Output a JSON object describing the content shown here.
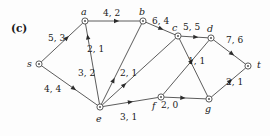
{
  "figure": {
    "panel_label": "(c)",
    "nodes": [
      {
        "id": "s",
        "label": "s",
        "x": 39,
        "y": 64,
        "label_x": 27,
        "label_y": 59
      },
      {
        "id": "a",
        "label": "a",
        "x": 85,
        "y": 21,
        "label_x": 81,
        "label_y": 7
      },
      {
        "id": "b",
        "label": "b",
        "x": 143,
        "y": 21,
        "label_x": 139,
        "label_y": 7
      },
      {
        "id": "c",
        "label": "c",
        "x": 178,
        "y": 36,
        "label_x": 172,
        "label_y": 23
      },
      {
        "id": "d",
        "label": "d",
        "x": 211,
        "y": 38,
        "label_x": 207,
        "label_y": 24
      },
      {
        "id": "t",
        "label": "t",
        "x": 248,
        "y": 66,
        "label_x": 257,
        "label_y": 60
      },
      {
        "id": "e",
        "label": "e",
        "x": 100,
        "y": 107,
        "label_x": 96,
        "label_y": 114
      },
      {
        "id": "f",
        "label": "f",
        "x": 161,
        "y": 97,
        "label_x": 152,
        "label_y": 101
      },
      {
        "id": "g",
        "label": "g",
        "x": 209,
        "y": 99,
        "label_x": 205,
        "label_y": 104
      }
    ],
    "edges": [
      {
        "id": "s-a",
        "from": "s",
        "to": "a",
        "label": "5, 3",
        "label_x": 48,
        "label_y": 34,
        "arrow_t": 0.62
      },
      {
        "id": "s-e",
        "from": "s",
        "to": "e",
        "label": "4, 4",
        "label_x": 44,
        "label_y": 85,
        "arrow_t": 0.58
      },
      {
        "id": "a-b",
        "from": "a",
        "to": "b",
        "label": "4, 2",
        "label_x": 103,
        "label_y": 9,
        "arrow_t": 0.55
      },
      {
        "id": "e-a",
        "from": "e",
        "to": "a",
        "label": "2, 1",
        "label_x": 87,
        "label_y": 45,
        "arrow_t": 0.84
      },
      {
        "id": "b-c",
        "from": "b",
        "to": "c",
        "label": "6, 4",
        "label_x": 152,
        "label_y": 17,
        "arrow_t": 0.52
      },
      {
        "id": "c-d",
        "from": "c",
        "to": "d",
        "label": "5, 5",
        "label_x": 183,
        "label_y": 23,
        "arrow_t": 0.55
      },
      {
        "id": "d-t",
        "from": "d",
        "to": "t",
        "label": "7, 6",
        "label_x": 226,
        "label_y": 36,
        "arrow_t": 0.58
      },
      {
        "id": "e-b",
        "from": "e",
        "to": "b",
        "label": "3, 2",
        "label_x": 78,
        "label_y": 69,
        "arrow_t": 0.3
      },
      {
        "id": "e-c",
        "from": "e",
        "to": "c",
        "label": "2, 1",
        "label_x": 120,
        "label_y": 69,
        "arrow_t": 0.3
      },
      {
        "id": "e-f",
        "from": "e",
        "to": "f",
        "label": "3, 1",
        "label_x": 120,
        "label_y": 113,
        "arrow_t": 0.5
      },
      {
        "id": "f-g",
        "from": "f",
        "to": "g",
        "label": "2, 0",
        "label_x": 161,
        "label_y": 101,
        "arrow_t": 0.45
      },
      {
        "id": "c-g",
        "from": "c",
        "to": "g",
        "label": "",
        "label_x": 0,
        "label_y": 0,
        "arrow_t": 0.0
      },
      {
        "id": "f-d",
        "from": "f",
        "to": "d",
        "label": "1, 1",
        "label_x": 188,
        "label_y": 57,
        "arrow_t": 0.62
      },
      {
        "id": "g-t",
        "from": "g",
        "to": "t",
        "label": "2, 1",
        "label_x": 226,
        "label_y": 78,
        "arrow_t": 0.55
      }
    ],
    "colors": {
      "edge": "#4a4a4a",
      "arrow": "#2b2b2b",
      "text": "#1a1a1a",
      "node_fill": "#ffffff",
      "background": "#fdfdfd"
    }
  }
}
